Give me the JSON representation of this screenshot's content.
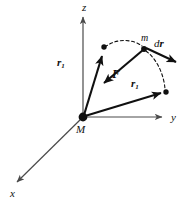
{
  "figure": {
    "background_color": "#ffffff",
    "ink_color": "#101010",
    "axis_color": "#4a4a4a",
    "width": 187,
    "height": 202
  },
  "axes": {
    "z": {
      "label": "z",
      "x": 82,
      "y": 2
    },
    "y": {
      "label": "y",
      "x": 171,
      "y": 112
    },
    "x": {
      "label": "x",
      "x": 10,
      "y": 188
    }
  },
  "bodies": {
    "central": {
      "label": "M",
      "x": 76,
      "y": 124
    },
    "moving": {
      "label": "m",
      "x": 141,
      "y": 33
    }
  },
  "vectors": [
    {
      "name": "r-one-upper",
      "label": "r",
      "sub": "1",
      "x": 57,
      "y": 57
    },
    {
      "name": "force",
      "label": "F",
      "sub": "",
      "x": 112,
      "y": 68
    },
    {
      "name": "r-one-lower",
      "label": "r",
      "sub": "1",
      "x": 131,
      "y": 78
    },
    {
      "name": "displacement",
      "label_d": "d",
      "label_r": "r",
      "x": 154,
      "y": 38
    }
  ]
}
